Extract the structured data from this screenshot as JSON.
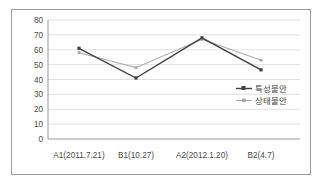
{
  "figure": {
    "border_color": "#9a9a9a",
    "background": "#ffffff"
  },
  "chart_data": {
    "type": "line",
    "title": "",
    "xlabel": "",
    "ylabel": "",
    "categories": [
      "A1(2011.7.21)",
      "B1(10.27)",
      "A2(2012.1.20)",
      "B2(4.7)"
    ],
    "series": [
      {
        "name": "특성불안",
        "values": [
          61,
          41,
          68,
          46.5
        ],
        "color": "#404040",
        "marker": "square"
      },
      {
        "name": "상태불안",
        "values": [
          58,
          48,
          67,
          53
        ],
        "color": "#a6a6a6",
        "marker": "square"
      }
    ],
    "ylim": [
      0,
      80
    ],
    "yticks": [
      0,
      10,
      20,
      30,
      40,
      50,
      60,
      70,
      80
    ],
    "ytick_labels": [
      "0",
      "10",
      "20",
      "30",
      "40",
      "50",
      "60",
      "70",
      "80"
    ],
    "grid": true,
    "grid_axis": "y",
    "legend_position": "right-middle"
  },
  "legend": {
    "entries": [
      {
        "label": "특성불안",
        "color": "#404040"
      },
      {
        "label": "상태불안",
        "color": "#a6a6a6"
      }
    ]
  }
}
